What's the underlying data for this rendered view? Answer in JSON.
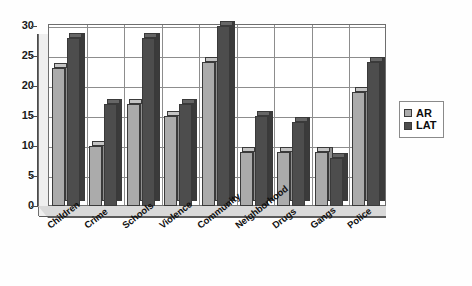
{
  "chart_data": {
    "type": "bar",
    "title": "",
    "subtitle": "",
    "xlabel": "",
    "ylabel": "",
    "ylim": [
      0,
      30
    ],
    "yticks": [
      0,
      5,
      10,
      15,
      20,
      25,
      30
    ],
    "grid": true,
    "legend_position": "right",
    "three_d": true,
    "categories": [
      "Children",
      "Crime",
      "Schools",
      "Violence",
      "Community",
      "Neighborhood",
      "Drugs",
      "Gangs",
      "Police"
    ],
    "series": [
      {
        "name": "AR",
        "color": "#ababab",
        "values": [
          23,
          10,
          17,
          15,
          24,
          9,
          9,
          9,
          19
        ]
      },
      {
        "name": "LAT",
        "color": "#4d4d4d",
        "values": [
          28,
          17,
          28,
          17,
          30,
          15,
          14,
          8,
          24
        ]
      }
    ]
  },
  "axis": {
    "y_tick_labels": [
      "30",
      "25",
      "20",
      "15",
      "10",
      "5",
      "0"
    ]
  },
  "legend": {
    "entries": [
      {
        "label": "AR",
        "swatch": "ar"
      },
      {
        "label": "LAT",
        "swatch": "lat"
      }
    ]
  }
}
